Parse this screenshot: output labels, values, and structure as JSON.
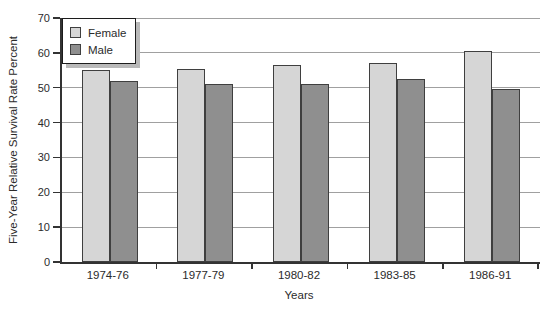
{
  "chart_data": {
    "type": "bar",
    "title": "",
    "xlabel": "Years",
    "ylabel": "Five-Year Relative Survival Rate Percent",
    "categories": [
      "1974-76",
      "1977-79",
      "1980-82",
      "1983-85",
      "1986-91"
    ],
    "series": [
      {
        "name": "Female",
        "color": "#d6d6d6",
        "values": [
          55,
          55.5,
          56.5,
          57,
          60.5
        ]
      },
      {
        "name": "Male",
        "color": "#8f8f8f",
        "values": [
          52,
          51,
          51,
          52.5,
          49.5
        ]
      }
    ],
    "ylim": [
      0,
      70
    ],
    "yticks": [
      0,
      10,
      20,
      30,
      40,
      50,
      60,
      70
    ],
    "grid": "horizontal",
    "legend_position": "top-left"
  },
  "style": {
    "female_fill": "#d6d6d6",
    "male_fill": "#8f8f8f",
    "bar_border": "#3f3f3f",
    "gridline": "#a0a0a0",
    "axis": "#333333",
    "legend_shadow": "#b9b9b9",
    "background": "#ffffff"
  }
}
